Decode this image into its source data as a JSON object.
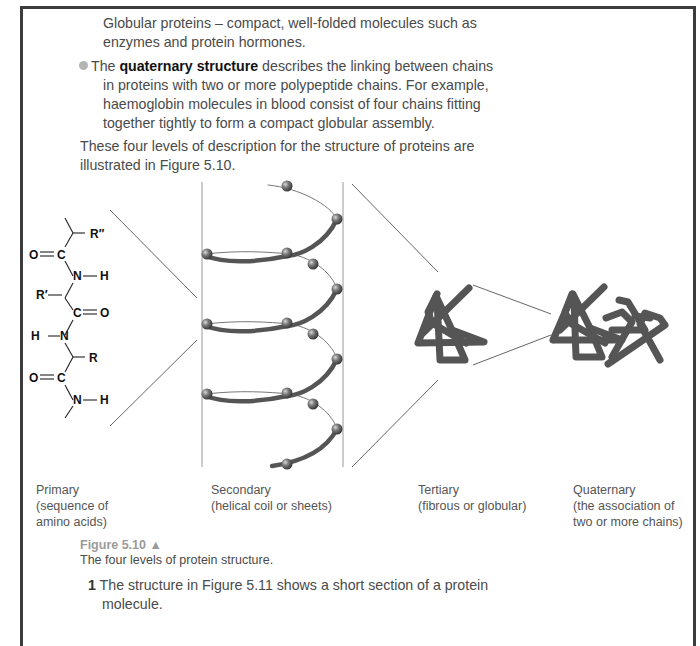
{
  "intro": {
    "globular_line1": "Globular proteins – compact, well-folded molecules such as",
    "globular_line2": "enzymes and protein hormones."
  },
  "quaternary_bullet": {
    "prefix": "The ",
    "term": "quaternary structure",
    "line1_rest": " describes the linking between chains",
    "line2": "in proteins with two or more polypeptide chains. For example,",
    "line3": "haemoglobin molecules in blood consist of four chains fitting",
    "line4": "together tightly to form a compact globular assembly."
  },
  "levels_paragraph": {
    "line1": "These four levels of description for the structure of proteins are",
    "line2": "illustrated in Figure 5.10."
  },
  "figure": {
    "primary": {
      "title": "Primary",
      "desc_line1": "(sequence of",
      "desc_line2": "amino acids)",
      "atoms": {
        "r_double_prime": "R′′",
        "o1": "O",
        "c1": "C",
        "n1": "N",
        "h1": "H",
        "r_prime": "R′",
        "c2": "C",
        "o2": "O",
        "h2": "H",
        "n2": "N",
        "r": "R",
        "o3": "O",
        "c3": "C",
        "n3": "N",
        "h3": "H"
      }
    },
    "secondary": {
      "title": "Secondary",
      "desc_line1": "(helical coil or sheets)"
    },
    "tertiary": {
      "title": "Tertiary",
      "desc_line1": "(fibrous or globular)"
    },
    "quaternary": {
      "title": "Quaternary",
      "desc_line1": "(the association of",
      "desc_line2": "two or more chains)"
    },
    "number": "Figure 5.10 ▲",
    "caption": "The four levels of protein structure."
  },
  "question": {
    "number": "1",
    "line1": " The structure in Figure 5.11 shows a short section of a protein",
    "line2": "molecule."
  },
  "colors": {
    "frame": "#3c3c3c",
    "text": "#4a4a4a",
    "bold_term": "#111111",
    "bullet": "#b4b4b4",
    "figure_number": "#9a9a9a",
    "chain": "#555555"
  }
}
